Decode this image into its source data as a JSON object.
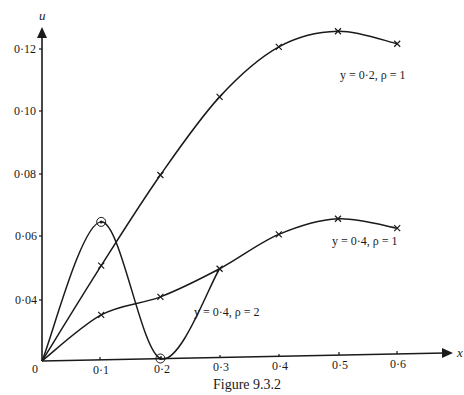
{
  "figure": {
    "caption": "Figure 9.3.2"
  },
  "chart_data": {
    "type": "line",
    "title": "",
    "caption": "Figure 9.3.2",
    "xlabel": "x",
    "ylabel": "u",
    "x_ticks": [
      "0",
      "0·1",
      "0·2",
      "0·3",
      "0·4",
      "0·5",
      "0·6"
    ],
    "y_ticks": [
      "0·04",
      "0·06",
      "0·08",
      "0·10",
      "0·12"
    ],
    "origin_label": "0",
    "xlim": [
      0,
      0.65
    ],
    "ylim": [
      0,
      0.13
    ],
    "grid": false,
    "legend": "inline annotations",
    "series": [
      {
        "name": "y = 0·2, ρ = 1",
        "x": [
          0,
          0.1,
          0.2,
          0.3,
          0.4,
          0.5,
          0.6
        ],
        "values": [
          0,
          0.051,
          0.08,
          0.105,
          0.121,
          0.126,
          0.122
        ],
        "marker": "cross"
      },
      {
        "name": "y = 0·4, ρ = 1",
        "x": [
          0,
          0.1,
          0.2,
          0.3,
          0.4,
          0.5,
          0.6
        ],
        "values": [
          0,
          0.03,
          0.041,
          0.05,
          0.061,
          0.066,
          0.063
        ],
        "marker": "cross"
      },
      {
        "name": "y = 0·4, ρ = 2",
        "x": [
          0,
          0.1,
          0.2,
          0.3
        ],
        "values": [
          0,
          0.065,
          0.0,
          0.05
        ],
        "marker": "circle (at x=0·1 and x=0·2)"
      }
    ],
    "annotations": [
      {
        "text": "y = 0·2, ρ = 1",
        "near_x": 0.6,
        "near_u": 0.118
      },
      {
        "text": "y = 0·4, ρ = 1",
        "near_x": 0.55,
        "near_u": 0.058
      },
      {
        "text": "y = 0·4, ρ = 2",
        "near_x": 0.3,
        "near_u": 0.036
      }
    ]
  }
}
